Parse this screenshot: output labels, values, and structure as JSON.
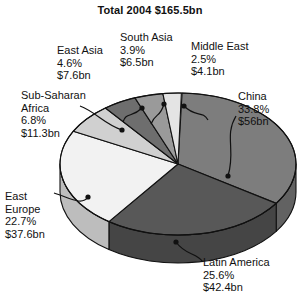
{
  "chart": {
    "title": "Total 2004 $165.5bn",
    "total_label": "Total 2004",
    "total_value": "$165.5bn"
  },
  "chart_data": {
    "type": "pie",
    "title": "Total 2004 $165.5bn",
    "xlabel": "",
    "ylabel": "",
    "legend": "none",
    "three_d": true,
    "unit": "US$ bn",
    "total": 165.5,
    "categories": [
      "China",
      "Latin America",
      "East Europe",
      "Sub-Saharan Africa",
      "East Asia",
      "South Asia",
      "Middle East"
    ],
    "values": [
      56.0,
      42.4,
      37.6,
      11.3,
      7.6,
      6.5,
      4.1
    ],
    "percents": [
      33.8,
      25.6,
      22.7,
      6.8,
      4.6,
      3.9,
      2.5
    ],
    "slices": [
      {
        "name": "China",
        "percent": "33.8%",
        "value": "$56bn",
        "color": "#7d7d7d"
      },
      {
        "name": "Latin America",
        "percent": "25.6%",
        "value": "$42.4bn",
        "color": "#585858"
      },
      {
        "name": "East Europe",
        "percent": "22.7%",
        "value": "$37.6bn",
        "color": "#f2f2f2"
      },
      {
        "name": "Sub-Saharan Africa",
        "percent": "6.8%",
        "value": "$11.3bn",
        "color": "#d0d0d0"
      },
      {
        "name": "East Asia",
        "percent": "4.6%",
        "value": "$7.6bn",
        "color": "#6e6e6e"
      },
      {
        "name": "South Asia",
        "percent": "3.9%",
        "value": "$6.5bn",
        "color": "#9a9a9a"
      },
      {
        "name": "Middle East",
        "percent": "2.5%",
        "value": "$4.1bn",
        "color": "#e4e4e4"
      }
    ]
  },
  "labels": {
    "east_asia": {
      "name": "East Asia",
      "percent": "4.6%",
      "value": "$7.6bn"
    },
    "south_asia": {
      "name": "South Asia",
      "percent": "3.9%",
      "value": "$6.5bn"
    },
    "middle_east": {
      "name": "Middle East",
      "percent": "2.5%",
      "value": "$4.1bn"
    },
    "china": {
      "name": "China",
      "percent": "33.8%",
      "value": "$56bn"
    },
    "sub_saharan": {
      "name1": "Sub-Saharan",
      "name2": "Africa",
      "percent": "6.8%",
      "value": "$11.3bn"
    },
    "east_europe": {
      "name1": "East",
      "name2": "Europe",
      "percent": "22.7%",
      "value": "$37.6bn"
    },
    "latin_america": {
      "name": "Latin America",
      "percent": "25.6%",
      "value": "$42.4bn"
    }
  }
}
